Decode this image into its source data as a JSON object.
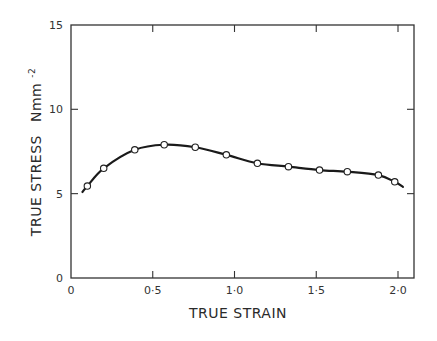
{
  "chart_data": {
    "type": "line",
    "title": "",
    "xlabel": "TRUE STRAIN",
    "ylabel": "TRUE STRESS",
    "ylabel_unit": "Nmm⁻²",
    "ylabel_unit_base": "Nmm",
    "ylabel_unit_sup": "-2",
    "xlim": [
      0,
      2.1
    ],
    "ylim": [
      0,
      15
    ],
    "xticks": [
      0,
      0.5,
      1.0,
      1.5,
      2.0
    ],
    "xtick_labels": [
      "0",
      "0·5",
      "1·0",
      "1·5",
      "2·0"
    ],
    "yticks": [
      0,
      5,
      10,
      15
    ],
    "ytick_labels": [
      "0",
      "5",
      "10",
      "15"
    ],
    "grid": false,
    "legend": null,
    "series": [
      {
        "name": "measured",
        "marker": "open-circle",
        "line": "smooth",
        "x": [
          0.1,
          0.2,
          0.39,
          0.57,
          0.76,
          0.95,
          1.14,
          1.33,
          1.52,
          1.69,
          1.88,
          1.98
        ],
        "y": [
          5.45,
          6.5,
          7.6,
          7.9,
          7.75,
          7.3,
          6.8,
          6.6,
          6.4,
          6.3,
          6.1,
          5.7
        ]
      }
    ],
    "curve_extent": {
      "x_start": 0.07,
      "y_start": 5.1,
      "x_end": 2.03,
      "y_end": 5.4
    }
  },
  "colors": {
    "line": "#1a1a1a",
    "axis": "#333333",
    "background": "#ffffff"
  }
}
